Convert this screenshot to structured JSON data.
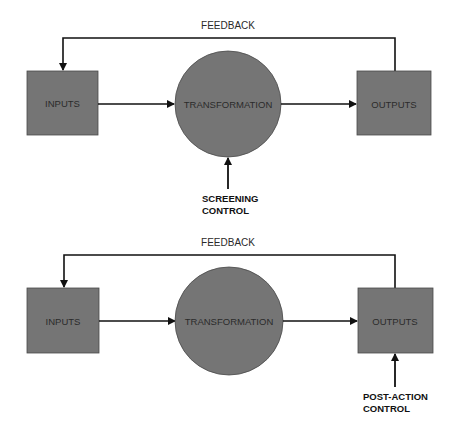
{
  "colors": {
    "node_fill": "#757575",
    "node_stroke": "#4a4a4a",
    "line": "#111111",
    "background": "#ffffff"
  },
  "diagrams": [
    {
      "feedback_label": "FEEDBACK",
      "inputs_label": "INPUTS",
      "transformation_label": "TRANSFORMATION",
      "outputs_label": "OUTPUTS",
      "control_label_line1": "SCREENING",
      "control_label_line2": "CONTROL",
      "control_target": "transformation"
    },
    {
      "feedback_label": "FEEDBACK",
      "inputs_label": "INPUTS",
      "transformation_label": "TRANSFORMATION",
      "outputs_label": "OUTPUTS",
      "control_label_line1": "POST-ACTION",
      "control_label_line2": "CONTROL",
      "control_target": "outputs"
    }
  ]
}
